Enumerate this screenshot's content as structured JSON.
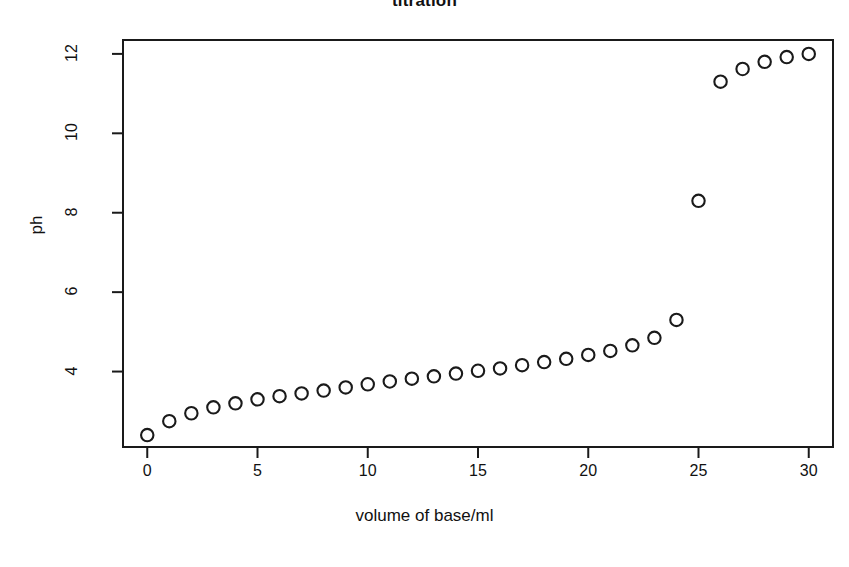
{
  "chart_data": {
    "type": "scatter",
    "title": "titration",
    "xlabel": "volume of base/ml",
    "ylabel": "ph",
    "xlim": [
      -1.1,
      31.1
    ],
    "ylim": [
      2.1,
      12.35
    ],
    "xticks": [
      0,
      5,
      10,
      15,
      20,
      25,
      30
    ],
    "yticks": [
      4,
      6,
      8,
      10,
      12
    ],
    "grid": false,
    "legend": null,
    "marker": "open-circle",
    "marker_color": "#1a1a1a",
    "x": [
      0,
      1,
      2,
      3,
      4,
      5,
      6,
      7,
      8,
      9,
      10,
      11,
      12,
      13,
      14,
      15,
      16,
      17,
      18,
      19,
      20,
      21,
      22,
      23,
      24,
      25,
      26,
      27,
      28,
      29,
      30
    ],
    "y": [
      2.4,
      2.75,
      2.95,
      3.1,
      3.2,
      3.3,
      3.38,
      3.45,
      3.52,
      3.6,
      3.68,
      3.75,
      3.82,
      3.88,
      3.95,
      4.02,
      4.08,
      4.16,
      4.24,
      4.32,
      4.42,
      4.52,
      4.66,
      4.85,
      5.3,
      8.3,
      11.3,
      11.62,
      11.8,
      11.92,
      12.0
    ],
    "series_name": "pH vs volume of base"
  },
  "axes": {
    "x_tick_labels": [
      "0",
      "5",
      "10",
      "15",
      "20",
      "25",
      "30"
    ],
    "y_tick_labels": [
      "4",
      "6",
      "8",
      "10",
      "12"
    ]
  }
}
